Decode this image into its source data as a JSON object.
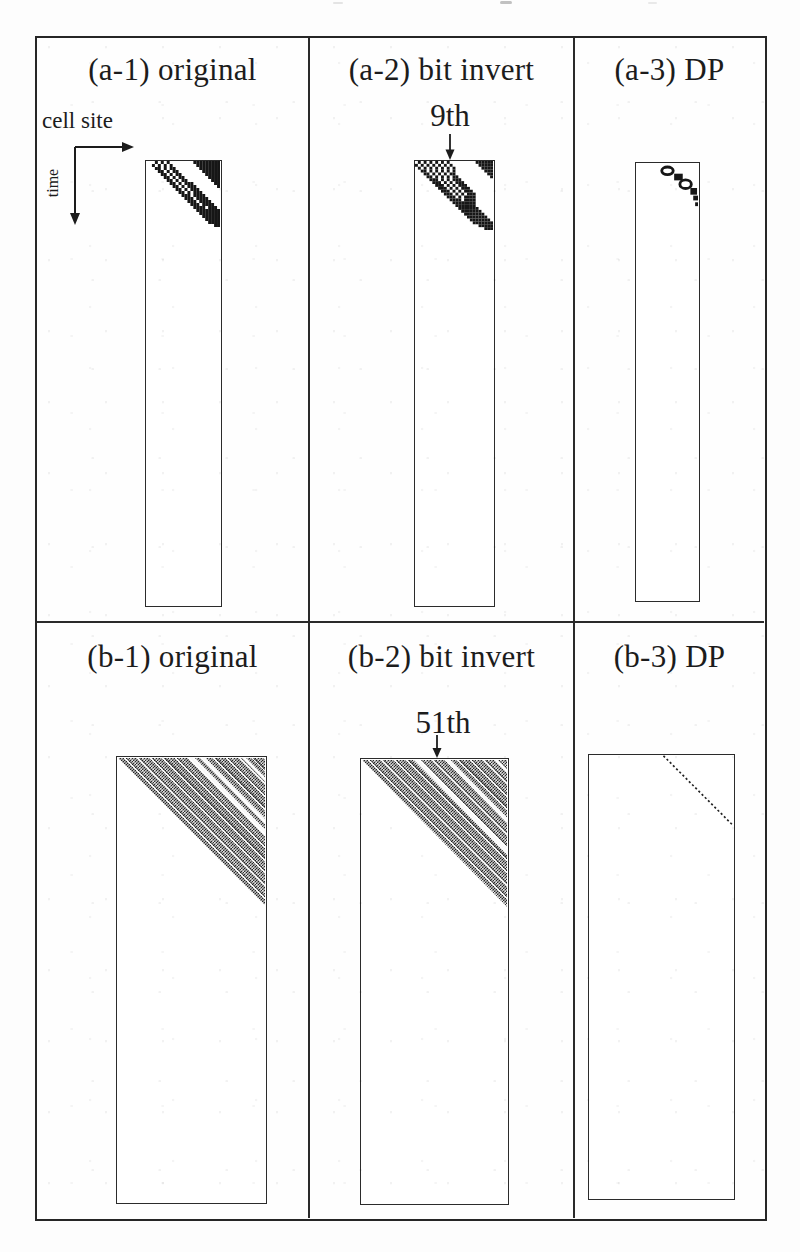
{
  "figure": {
    "axis_labels": {
      "x": "cell site",
      "y": "time"
    },
    "rows": [
      {
        "panels": [
          {
            "key": "a1",
            "title": "(a-1) original"
          },
          {
            "key": "a2",
            "title": "(a-2) bit invert",
            "annotation": "9th"
          },
          {
            "key": "a3",
            "title": "(a-3) DP"
          }
        ]
      },
      {
        "panels": [
          {
            "key": "b1",
            "title": "(b-1) original"
          },
          {
            "key": "b2",
            "title": "(b-2) bit invert",
            "annotation": "51th"
          },
          {
            "key": "b3",
            "title": "(b-3) DP"
          }
        ]
      }
    ]
  },
  "patterns": {
    "cell_px": 3,
    "ink": "#161616",
    "a1_rows": [
      "...#.#.#........#########",
      "..#.#.#.#........########",
      "...##.#.##........#######",
      "....##.#.##........######",
      ".....##.#.##........#####",
      "......##.#.##........####",
      ".......##.#.##........###",
      "........##.#.###.......##",
      ".........##.#.###.......#",
      "..........##.#.###.......",
      "...........##.#.###......",
      "............###.####.....",
      ".............###.####....",
      "..............###.####...",
      "...............###.####..",
      "................####.###.",
      ".................########",
      "..................#######",
      "...................######",
      "....................#####",
      ".....................####",
      ".......................##"
    ],
    "a2_rows": [
      ".#.#.#.#.#.#.........######",
      "#.#.#.#.#.#.#.........#####",
      ".#.#.#.#.#.#.#.........####",
      "..##.#.#.#.#.#..........###",
      "...##.#.#.#.##...........##",
      "....##.#.#.#.##...........#",
      ".....###.#.#.###...........",
      "......###.#.#.###..........",
      ".......###.#.#.###.........",
      "........###.#.#.###........",
      ".........###.#.#.###.......",
      "..........###.#.#.###......",
      "...........###.#.####......",
      "............####.####......",
      ".............########......",
      "..............#######......",
      "...............#######.....",
      "................#######....",
      ".................#######...",
      "..................#######..",
      "...................#######.",
      "....................#######",
      "......................#####",
      "........................###"
    ],
    "a3_blobs": [
      {
        "t": "ring",
        "cx": 33,
        "cy": 7,
        "rx": 6,
        "ry": 4
      },
      {
        "t": "rect",
        "x": 40,
        "y": 10,
        "w": 9,
        "h": 7
      },
      {
        "t": "ring",
        "cx": 52,
        "cy": 21,
        "rx": 6,
        "ry": 4.5
      },
      {
        "t": "rect",
        "x": 57,
        "y": 25,
        "w": 7,
        "h": 7
      },
      {
        "t": "rect",
        "x": 60,
        "y": 33,
        "w": 5,
        "h": 5
      },
      {
        "t": "rect",
        "x": 62,
        "y": 40,
        "w": 4,
        "h": 4
      }
    ],
    "b1_stripes": [
      {
        "x": 64,
        "w": 5
      },
      {
        "x": 76,
        "w": 4
      },
      {
        "x": 118,
        "w": 3
      }
    ],
    "b2_stripes": [
      {
        "x": 46,
        "w": 5
      },
      {
        "x": 77,
        "w": 4
      },
      {
        "x": 126,
        "w": 3
      }
    ],
    "b3_line": {
      "x1": 76,
      "y1": 0,
      "x2": 146,
      "y2": 70
    }
  }
}
